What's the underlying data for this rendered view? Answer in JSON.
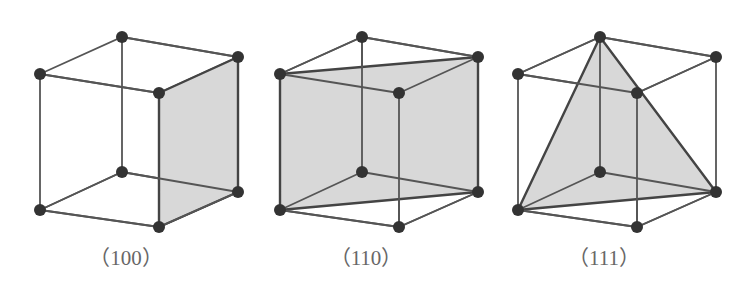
{
  "figure": {
    "background_color": "#ffffff",
    "edge_color": "#555555",
    "vertex_color": "#333333",
    "plane_fill_color": "#d8d8d8",
    "plane_stroke_color": "#444444",
    "caption_color": "#676767"
  },
  "cubes": [
    {
      "id": "100",
      "caption": "（100）",
      "miller_index": "(100)",
      "plane_name": "right-face-plane",
      "plane_kind": "square-face",
      "plane_vertices": [
        "top-back-right",
        "top-front-center",
        "bottom-front",
        "bottom-right"
      ]
    },
    {
      "id": "110",
      "caption": "（110）",
      "miller_index": "(110)",
      "plane_name": "diagonal-rectangle-plane",
      "plane_kind": "diagonal-rectangle",
      "plane_vertices": [
        "top-back-left",
        "top-back-right",
        "bottom-right",
        "bottom-left"
      ]
    },
    {
      "id": "111",
      "caption": "（111）",
      "miller_index": "(111)",
      "plane_name": "diagonal-triangle-plane",
      "plane_kind": "triangle",
      "plane_vertices": [
        "top-back-center",
        "bottom-left",
        "bottom-right"
      ]
    }
  ],
  "geometry": {
    "vertices": {
      "top-back-center": [
        122,
        37
      ],
      "top-back-left": [
        40,
        74
      ],
      "top-back-right": [
        238,
        57
      ],
      "top-front-center": [
        159,
        93
      ],
      "bottom-back-left": [
        40,
        210
      ],
      "bottom-front-center": [
        122,
        172
      ],
      "bottom-front": [
        159,
        227
      ],
      "bottom-right": [
        238,
        192
      ]
    },
    "vertex_radius": 6,
    "edge_width": 1.8,
    "plane_edge_width": 2.4
  }
}
